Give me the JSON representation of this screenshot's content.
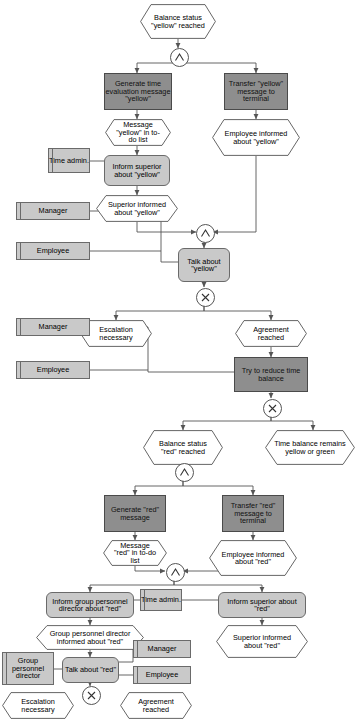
{
  "diagram": {
    "type": "epc-flowchart",
    "caption": "Figure 5.21 Time evaluation process escalation procedure (EPC)",
    "colors": {
      "function_dark": "#8e8e8e",
      "function_light": "#c9c9c9",
      "org_unit": "#c9c9c9",
      "event_fill": "#ffffff",
      "line": "#555555",
      "text": "#000000"
    },
    "legend": {
      "event_shape": "hexagon",
      "function_shape": "rounded-rectangle",
      "org_unit_shape": "rectangle-with-spine",
      "operator_and": "AND",
      "operator_xor": "XOR"
    }
  },
  "nodes": {
    "e_balance_yellow": {
      "kind": "event",
      "label": "Balance status \"yellow\" reached"
    },
    "op1": {
      "kind": "operator",
      "label": "AND"
    },
    "f_generate_yellow": {
      "kind": "function",
      "style": "dark",
      "label": "Generate time evaluation message \"yellow\""
    },
    "f_transfer_yellow": {
      "kind": "function",
      "style": "dark",
      "label": "Transfer \"yellow\" message to terminal"
    },
    "e_msg_yellow_todo": {
      "kind": "event",
      "label": "Message \"yellow\" in to-do list"
    },
    "e_emp_informed_yel": {
      "kind": "event",
      "label": "Employee informed about \"yellow\""
    },
    "o_time_admin_1": {
      "kind": "org",
      "label": "Time admin."
    },
    "f_inform_sup_yellow": {
      "kind": "function",
      "style": "light",
      "label": "Inform superior about \"yellow\""
    },
    "e_sup_informed_yel": {
      "kind": "event",
      "label": "Superior informed about \"yellow\""
    },
    "op2": {
      "kind": "operator",
      "label": "AND"
    },
    "o_manager_1": {
      "kind": "org",
      "label": "Manager"
    },
    "o_employee_1": {
      "kind": "org",
      "label": "Employee"
    },
    "f_talk_yellow": {
      "kind": "function",
      "style": "light",
      "label": "Talk about \"yellow\""
    },
    "op3": {
      "kind": "operator",
      "label": "XOR"
    },
    "e_escalation_1": {
      "kind": "event",
      "label": "Escalation necessary"
    },
    "e_agreement_1": {
      "kind": "event",
      "label": "Agreement reached"
    },
    "o_manager_2": {
      "kind": "org",
      "label": "Manager"
    },
    "o_employee_2": {
      "kind": "org",
      "label": "Employee"
    },
    "f_reduce_balance": {
      "kind": "function",
      "style": "dark",
      "label": "Try to reduce time balance"
    },
    "op4": {
      "kind": "operator",
      "label": "XOR"
    },
    "e_balance_red": {
      "kind": "event",
      "label": "Balance status \"red\" reached"
    },
    "e_remains_yel_green": {
      "kind": "event",
      "label": "Time balance remains yellow or green"
    },
    "op5": {
      "kind": "operator",
      "label": "AND"
    },
    "f_generate_red": {
      "kind": "function",
      "style": "dark",
      "label": "Generate \"red\" message"
    },
    "f_transfer_red": {
      "kind": "function",
      "style": "dark",
      "label": "Transfer \"red\" message to terminal"
    },
    "e_msg_red_todo": {
      "kind": "event",
      "label": "Message \"red\" in to-do list"
    },
    "e_emp_informed_red": {
      "kind": "event",
      "label": "Employee informed about \"red\""
    },
    "op6": {
      "kind": "operator",
      "label": "AND"
    },
    "f_inform_gpd_red": {
      "kind": "function",
      "style": "light",
      "label": "Inform group personnel director about \"red\""
    },
    "o_time_admin_2": {
      "kind": "org",
      "label": "Time admin."
    },
    "f_inform_sup_red": {
      "kind": "function",
      "style": "light",
      "label": "Inform superior about \"red\""
    },
    "e_gpd_informed_red": {
      "kind": "event",
      "label": "Group personnel director informed about \"red\""
    },
    "e_sup_informed_red": {
      "kind": "event",
      "label": "Superior informed about \"red\""
    },
    "o_gpd": {
      "kind": "org",
      "label": "Group personnel director"
    },
    "f_talk_red": {
      "kind": "function",
      "style": "light",
      "label": "Talk about \"red\""
    },
    "o_manager_3": {
      "kind": "org",
      "label": "Manager"
    },
    "o_employee_3": {
      "kind": "org",
      "label": "Employee"
    },
    "op7": {
      "kind": "operator",
      "label": "XOR"
    },
    "e_escalation_2": {
      "kind": "event",
      "label": "Escalation necessary"
    },
    "e_agreement_2": {
      "kind": "event",
      "label": "Agreement reached"
    }
  }
}
